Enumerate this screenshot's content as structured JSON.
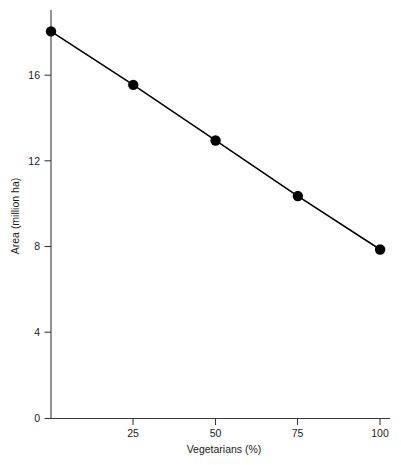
{
  "chart_data": {
    "type": "line",
    "title": "",
    "subtitle": "",
    "xlabel": "Vegetarians (%)",
    "ylabel": "Area (million ha)",
    "x": [
      0,
      25,
      50,
      75,
      100
    ],
    "series": [
      {
        "name": "Area",
        "values": [
          18.1,
          15.6,
          13.0,
          10.4,
          7.9
        ]
      }
    ],
    "xlim": [
      0,
      103
    ],
    "ylim": [
      0,
      19.1
    ],
    "xticks": [
      25,
      50,
      75,
      100
    ],
    "xtick_labels": [
      "25",
      "50",
      "75",
      "100"
    ],
    "yticks": [
      0,
      4,
      8,
      12,
      16
    ],
    "ytick_labels": [
      "0",
      "4",
      "8",
      "12",
      "16"
    ],
    "grid": false,
    "legend": false,
    "legend_position": "none",
    "marker": "filled-circle",
    "line_color": "#000000",
    "marker_color": "#000000",
    "axis_color": "#3a3a3a",
    "background_color": "#ffffff",
    "annotations": []
  },
  "axes": {
    "y_tick_0": "0",
    "y_tick_4": "4",
    "y_tick_8": "8",
    "y_tick_12": "12",
    "y_tick_16": "16",
    "x_tick_25": "25",
    "x_tick_50": "50",
    "x_tick_75": "75",
    "x_tick_100": "100",
    "x_title": "Vegetarians (%)",
    "y_title": "Area (million ha)"
  }
}
